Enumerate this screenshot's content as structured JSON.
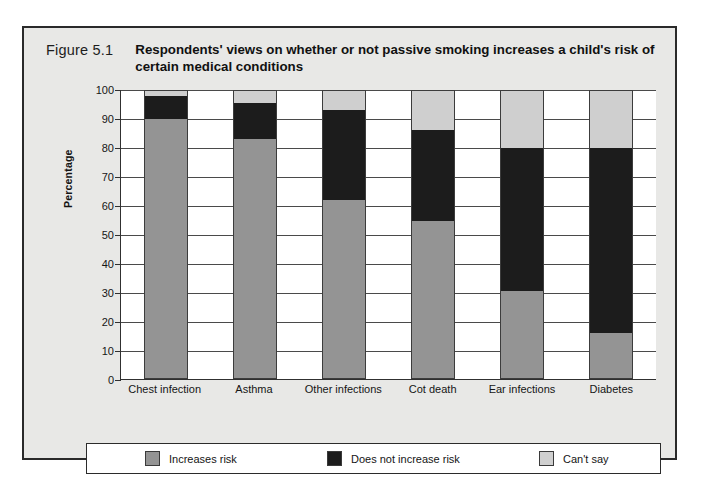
{
  "figure": {
    "number": "Figure 5.1",
    "title": "Respondents' views on whether or not passive smoking increases a child's risk of certain medical conditions"
  },
  "chart_data": {
    "type": "bar",
    "stacked": true,
    "title": "Respondents' views on whether or not passive smoking increases a child's risk of certain medical conditions",
    "xlabel": "",
    "ylabel": "Percentage",
    "ylim": [
      0,
      100
    ],
    "ytick_step": 10,
    "yticks": [
      100,
      90,
      80,
      70,
      60,
      50,
      40,
      30,
      20,
      10,
      0
    ],
    "grid": true,
    "legend_position": "bottom",
    "categories": [
      "Chest infection",
      "Asthma",
      "Other infections",
      "Cot death",
      "Ear infections",
      "Diabetes"
    ],
    "series": [
      {
        "name": "Increases risk",
        "color": "#949494",
        "values": [
          90,
          83,
          62,
          54.5,
          30.5,
          16
        ]
      },
      {
        "name": "Does not increase risk",
        "color": "#1c1c1c",
        "values": [
          8,
          12.5,
          31,
          31.5,
          49.5,
          64
        ]
      },
      {
        "name": "Can't say",
        "color": "#cfcfcf",
        "values": [
          2,
          4.5,
          7,
          14,
          20,
          20
        ]
      }
    ]
  },
  "legend": {
    "items": [
      {
        "label": "Increases risk",
        "color": "#949494"
      },
      {
        "label": "Does not increase risk",
        "color": "#1c1c1c"
      },
      {
        "label": "Can't say",
        "color": "#cfcfcf"
      }
    ]
  }
}
